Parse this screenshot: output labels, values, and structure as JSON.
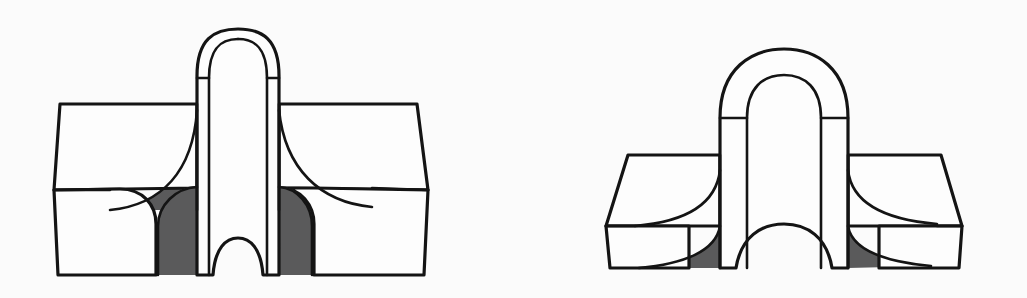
{
  "figure_set": {
    "title": "",
    "background_color": "#fbfbfb",
    "line_color": "#141414",
    "surface_color": "#fdfdfd",
    "shadow_color": "#5a5a5b",
    "figure_count": 2,
    "caption": ""
  },
  "figures": [
    {
      "id": "left-figure",
      "name": "cruciform-fillet-weld-joint-rounded-boss",
      "description": "Isometric line drawing of a cruciform joint: a tall vertical rounded-top web passing through a horizontal plate, with shaded concave fillet transitions at the four re-entrant corners.",
      "bounds": {
        "x": 52,
        "y": 27,
        "width": 380,
        "height": 252
      },
      "parts": [
        {
          "name": "vertical-web-rounded-cap",
          "shading": "white"
        },
        {
          "name": "web-side-face-left",
          "shading": "white"
        },
        {
          "name": "web-side-face-right",
          "shading": "white"
        },
        {
          "name": "horizontal-plate-top-face",
          "shading": "white"
        },
        {
          "name": "horizontal-plate-front-edge",
          "shading": "white"
        },
        {
          "name": "fillet-upper-left",
          "shading": "gray"
        },
        {
          "name": "fillet-upper-right",
          "shading": "gray"
        },
        {
          "name": "fillet-lower-left",
          "shading": "gray"
        },
        {
          "name": "fillet-lower-right",
          "shading": "gray"
        },
        {
          "name": "bottom-scallop-cutout",
          "shading": "white"
        }
      ]
    },
    {
      "id": "right-figure",
      "name": "cruciform-stepped-plate-wide-boss",
      "description": "Isometric line drawing of a wide domed boss intersecting a stepped horizontal plate, with shaded concave fillets at the re-entrant corners and a scalloped underside.",
      "bounds": {
        "x": 604,
        "y": 49,
        "width": 376,
        "height": 225
      },
      "parts": [
        {
          "name": "wide-dome-outer-rim",
          "shading": "white"
        },
        {
          "name": "wide-dome-inner-face",
          "shading": "white"
        },
        {
          "name": "boss-side-face-left",
          "shading": "white"
        },
        {
          "name": "boss-side-face-right",
          "shading": "white"
        },
        {
          "name": "boss-front-face",
          "shading": "white"
        },
        {
          "name": "stepped-plate-left-top-face",
          "shading": "white"
        },
        {
          "name": "stepped-plate-left-edge",
          "shading": "white"
        },
        {
          "name": "stepped-plate-right-top-face",
          "shading": "white"
        },
        {
          "name": "stepped-plate-right-edge",
          "shading": "white"
        },
        {
          "name": "fillet-upper-left",
          "shading": "gray"
        },
        {
          "name": "fillet-upper-right",
          "shading": "gray"
        },
        {
          "name": "fillet-lower-left",
          "shading": "gray"
        },
        {
          "name": "fillet-lower-right",
          "shading": "gray"
        },
        {
          "name": "bottom-scallop-cutout",
          "shading": "white"
        }
      ]
    }
  ]
}
